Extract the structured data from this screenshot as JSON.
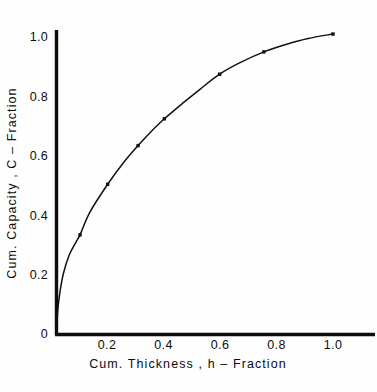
{
  "chart_data": {
    "type": "line",
    "title": "",
    "subtitle": "",
    "xlabel": "Cum.  Thickness , h  –  Fraction",
    "ylabel": "Cum. Capacity , C  –  Fraction",
    "xlim": [
      0,
      1.13
    ],
    "ylim": [
      0,
      1.07
    ],
    "xticks": [
      0.2,
      0.4,
      0.6,
      0.8,
      1.0
    ],
    "xticklabels": [
      "0.2",
      "0.4",
      "0.6",
      "0.8",
      "1.0"
    ],
    "yticks": [
      0,
      0.2,
      0.4,
      0.6,
      0.8,
      1.0
    ],
    "yticklabels": [
      "0",
      "0.2",
      "0.4",
      "0.6",
      "0.8",
      "1.0"
    ],
    "grid": false,
    "legend": null,
    "legend_position": "none",
    "marker": "filled-square",
    "line_color": "#111111",
    "series": [
      {
        "name": "Cumulative capacity vs cumulative thickness",
        "x": [
          0.085,
          0.185,
          0.295,
          0.39,
          0.59,
          0.75,
          1.0
        ],
        "y": [
          0.335,
          0.505,
          0.635,
          0.725,
          0.875,
          0.95,
          1.01
        ]
      }
    ],
    "curve_x": [
      0.0,
      0.004,
      0.012,
      0.025,
      0.045,
      0.07,
      0.085,
      0.12,
      0.185,
      0.24,
      0.295,
      0.34,
      0.39,
      0.46,
      0.52,
      0.59,
      0.66,
      0.75,
      0.83,
      0.91,
      1.0
    ],
    "curve_y": [
      0.0,
      0.075,
      0.14,
      0.205,
      0.265,
      0.31,
      0.335,
      0.41,
      0.505,
      0.575,
      0.635,
      0.68,
      0.725,
      0.78,
      0.825,
      0.875,
      0.912,
      0.95,
      0.975,
      0.995,
      1.01
    ],
    "annotations": []
  },
  "axes": {
    "x_tick_labels": [
      "0.2",
      "0.4",
      "0.6",
      "0.8",
      "1.0"
    ],
    "y_tick_labels": [
      "1.0",
      "0.8",
      "0.6",
      "0.4",
      "0.2",
      "0"
    ],
    "x_title": "Cum.  Thickness , h  –  Fraction",
    "y_title": "Cum. Capacity , C  –  Fraction"
  },
  "colors": {
    "ink": "#0d0d0d",
    "curve": "#111111",
    "paper": "#fefefe"
  }
}
